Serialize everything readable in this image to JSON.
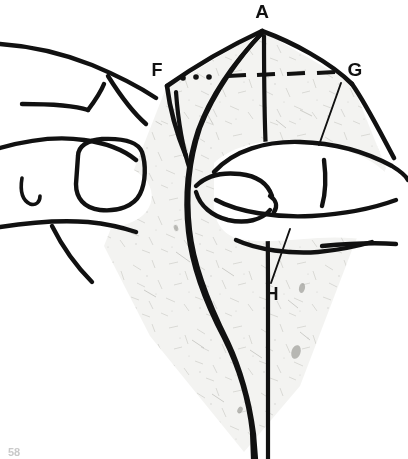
{
  "figure": {
    "background_color": "#ffffff",
    "ink_color": "#111111",
    "paper_fill_color": "#f3f3f1",
    "paper_speckle_color": "#b9b9b4",
    "hand_fill_color": "#ffffff"
  },
  "labels": [
    {
      "id": "label-a",
      "text": "A",
      "x": 262,
      "y": 18,
      "font_size": 19
    },
    {
      "id": "label-f",
      "text": "F",
      "x": 157,
      "y": 76,
      "font_size": 18
    },
    {
      "id": "label-g",
      "text": "G",
      "x": 355,
      "y": 76,
      "font_size": 19
    },
    {
      "id": "label-h",
      "text": "H",
      "x": 272,
      "y": 300,
      "font_size": 18
    }
  ],
  "page_number": {
    "text": "58",
    "x": 10,
    "y": 455,
    "font_size": 11
  },
  "guides": {
    "dots_label": "alignment dots",
    "dots": [
      {
        "cx": 183,
        "cy": 78,
        "r": 2.6
      },
      {
        "cx": 196,
        "cy": 77,
        "r": 2.6
      },
      {
        "cx": 209,
        "cy": 77,
        "r": 2.6
      }
    ],
    "dashes_label": "fold guide dashes",
    "dashes": [
      {
        "x1": 228,
        "y1": 75,
        "x2": 245,
        "y2": 75
      },
      {
        "x1": 256,
        "y1": 74,
        "x2": 274,
        "y2": 74
      },
      {
        "x1": 286,
        "y1": 73,
        "x2": 304,
        "y2": 73
      },
      {
        "x1": 316,
        "y1": 72,
        "x2": 334,
        "y2": 72
      }
    ]
  },
  "leader_lines": [
    {
      "id": "leader-g",
      "x1": 341,
      "y1": 83,
      "x2": 319,
      "y2": 143
    },
    {
      "id": "leader-h",
      "x1": 290,
      "y1": 229,
      "x2": 270,
      "y2": 283
    }
  ]
}
